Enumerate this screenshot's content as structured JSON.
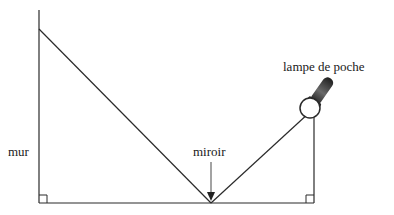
{
  "diagram": {
    "labels": {
      "wall": "mur",
      "mirror": "miroir",
      "flashlight": "lampe de poche"
    },
    "colors": {
      "line": "#2a2a2a",
      "arrow": "#555555",
      "flashlight_body": "#3a3a3a"
    },
    "elements": [
      "wall",
      "ground",
      "incident-ray",
      "reflected-ray",
      "flashlight-pole",
      "mirror-arrow",
      "right-angle-left",
      "right-angle-right",
      "flashlight"
    ]
  }
}
